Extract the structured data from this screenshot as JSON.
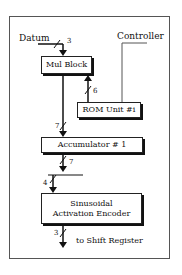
{
  "diagram": {
    "inputs": {
      "datum": "Datum",
      "controller": "Controller"
    },
    "blocks": {
      "mul_block": "Mul Block",
      "rom_unit": "ROM Unit #i",
      "accumulator": "Accumulator # 1",
      "encoder_line1": "Sinusoidal",
      "encoder_line2": "Activation Encoder"
    },
    "bus_widths": {
      "datum_to_mul": "3",
      "rom_to_mul": "6",
      "mul_to_acc": "7",
      "acc_out": "7",
      "bus_to_encoder": "4",
      "encoder_out": "3"
    },
    "output": {
      "label": "to Shift Register"
    }
  }
}
